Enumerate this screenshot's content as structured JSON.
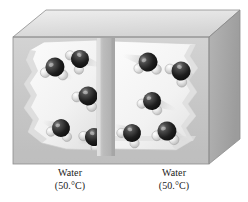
{
  "figure": {
    "background_color": "#ffffff",
    "box": {
      "name": "insulated-container",
      "top_face_color": "#e3e3e3",
      "front_face_color": "#c9c9c9",
      "right_face_color": "#a9a9a9",
      "edge_color": "#8f8f8f",
      "bevel_color": "#d8d8d8"
    },
    "divider": {
      "name": "partition",
      "color": "#b5b5b5",
      "highlight_color": "#cfcfcf"
    },
    "water_fill_color": "#f4f4f4",
    "water_shadow_color": "#cfcfcf",
    "molecule": {
      "oxygen_color": "#1c1c1c",
      "oxygen_highlight": "#8a8a8a",
      "hydrogen_color": "#dcdcdc",
      "hydrogen_highlight": "#ffffff",
      "motion_blur_color": "#b9b9b9"
    }
  },
  "compartments": [
    {
      "side": "left",
      "label_line1": "Water",
      "label_line2": "(50.°C)",
      "temperature_value": "50.",
      "temperature_unit": "°C",
      "molecule_count": 5,
      "molecules": [
        {
          "cx": 55,
          "cy": 67,
          "r": 9.5,
          "rot": -20,
          "blur": 22,
          "blur_angle": 35
        },
        {
          "cx": 80,
          "cy": 59,
          "r": 9.0,
          "rot": 30,
          "blur": 24,
          "blur_angle": 18
        },
        {
          "cx": 88,
          "cy": 96,
          "r": 9.5,
          "rot": 5,
          "blur": 26,
          "blur_angle": 10
        },
        {
          "cx": 61,
          "cy": 128,
          "r": 9.0,
          "rot": -10,
          "blur": 20,
          "blur_angle": 200
        },
        {
          "cx": 94,
          "cy": 137,
          "r": 9.0,
          "rot": 15,
          "blur": 18,
          "blur_angle": 160
        }
      ]
    },
    {
      "side": "right",
      "label_line1": "Water",
      "label_line2": "(50.°C)",
      "temperature_value": "50.",
      "temperature_unit": "°C",
      "molecule_count": 5,
      "molecules": [
        {
          "cx": 148,
          "cy": 62,
          "r": 9.5,
          "rot": -25,
          "blur": 26,
          "blur_angle": 195
        },
        {
          "cx": 181,
          "cy": 71,
          "r": 9.5,
          "rot": 20,
          "blur": 22,
          "blur_angle": 30
        },
        {
          "cx": 152,
          "cy": 101,
          "r": 9.0,
          "rot": -5,
          "blur": 26,
          "blur_angle": 20
        },
        {
          "cx": 132,
          "cy": 133,
          "r": 9.0,
          "rot": 10,
          "blur": 20,
          "blur_angle": 205
        },
        {
          "cx": 167,
          "cy": 131,
          "r": 9.5,
          "rot": -15,
          "blur": 24,
          "blur_angle": 25
        }
      ]
    }
  ]
}
